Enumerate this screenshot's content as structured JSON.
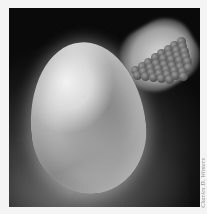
{
  "image": {
    "description": "Photo-illustration of a white egg on a dark background with a glowing cluster of spherical atoms (molecular model) in the upper right",
    "subjects": [
      "egg",
      "molecular-cluster"
    ],
    "colors": {
      "background_dark": "#0a0a0a",
      "egg_highlight": "#f2f2f2",
      "egg_shadow": "#8a8a8a",
      "atom": "#5e5e5e",
      "halo": "#e0e0e0",
      "border": "#f4f4f4"
    }
  },
  "credit": {
    "text": "Charles D. Winters"
  }
}
